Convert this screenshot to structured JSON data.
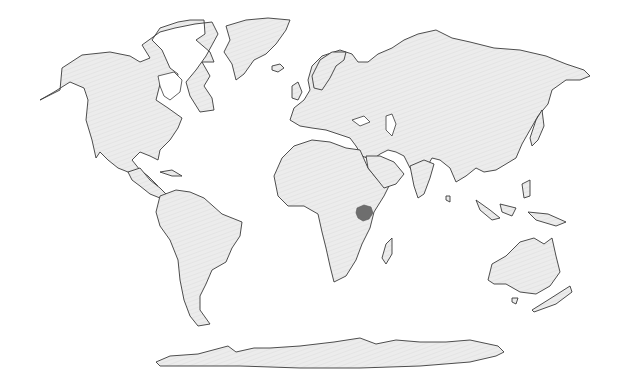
{
  "map": {
    "type": "world-choropleth",
    "projection": "Robinson-like",
    "background_color": "#ffffff",
    "land_fill": "#e6e6e6",
    "land_stroke": "#3a3a3a",
    "highlight_color": "#6e6e6e",
    "highlighted_regions": [
      {
        "name": "East Africa (Lake Victoria region)",
        "approx_center_px": [
          364,
          213
        ]
      }
    ],
    "labels": [],
    "legend": null
  }
}
